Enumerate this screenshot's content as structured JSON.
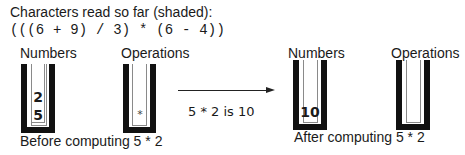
{
  "header": {
    "title": "Characters read so far (shaded):",
    "expression": "(((6 + 9) / 3) * (6 - 4))"
  },
  "before": {
    "numbers_label": "Numbers",
    "operations_label": "Operations",
    "numbers_stack": [
      "2",
      "5"
    ],
    "operations_stack": [
      "*"
    ],
    "caption": "Before computing 5 * 2"
  },
  "transition": {
    "label": "5 * 2 is 10"
  },
  "after": {
    "numbers_label": "Numbers",
    "operations_label": "Operations",
    "numbers_stack": [
      "10"
    ],
    "operations_stack": [],
    "caption": "After computing 5 * 2"
  }
}
